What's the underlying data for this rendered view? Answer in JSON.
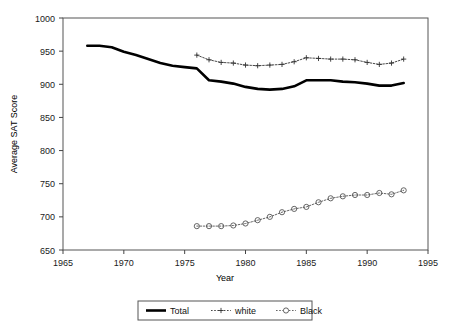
{
  "figure": {
    "title": "",
    "background": "#ffffff",
    "frame_color": "#555555"
  },
  "axes": {
    "y_axis_label": "Average SAT Score",
    "x_axis_label": "Year",
    "y_ticks": [
      650,
      700,
      750,
      800,
      850,
      900,
      950,
      1000
    ],
    "x_ticks": [
      1965,
      1970,
      1975,
      1980,
      1985,
      1990,
      1995
    ],
    "xlim": [
      1965,
      1995
    ],
    "ylim": [
      650,
      1000
    ],
    "grid": false
  },
  "legend": {
    "position": "bottom-center",
    "entries": [
      {
        "label": "Total",
        "marker": "none",
        "style": "thick-solid",
        "color": "#000000"
      },
      {
        "label": "white",
        "marker": "plus",
        "style": "dotted",
        "color": "#333333"
      },
      {
        "label": "Black",
        "marker": "circle",
        "style": "dotted",
        "color": "#555555"
      }
    ]
  },
  "chart_data": {
    "type": "line",
    "title": "",
    "xlabel": "Year",
    "ylabel": "Average SAT Score",
    "xlim": [
      1965,
      1995
    ],
    "ylim": [
      650,
      1000
    ],
    "xticks": [
      1965,
      1970,
      1975,
      1980,
      1985,
      1990,
      1995
    ],
    "yticks": [
      650,
      700,
      750,
      800,
      850,
      900,
      950,
      1000
    ],
    "grid": false,
    "legend_position": "bottom-center",
    "series": [
      {
        "name": "Total",
        "marker": "none",
        "linestyle": "thick-solid",
        "color": "#000000",
        "x": [
          1967,
          1968,
          1969,
          1970,
          1971,
          1972,
          1973,
          1974,
          1975,
          1976,
          1977,
          1978,
          1979,
          1980,
          1981,
          1982,
          1983,
          1984,
          1985,
          1986,
          1987,
          1988,
          1989,
          1990,
          1991,
          1992,
          1993
        ],
        "values": [
          958,
          958,
          956,
          949,
          944,
          938,
          932,
          928,
          926,
          924,
          906,
          904,
          901,
          896,
          893,
          892,
          893,
          897,
          906,
          906,
          906,
          904,
          903,
          901,
          898,
          898,
          902
        ]
      },
      {
        "name": "white",
        "marker": "plus",
        "linestyle": "dotted",
        "color": "#333333",
        "x": [
          1976,
          1977,
          1978,
          1979,
          1980,
          1981,
          1982,
          1983,
          1984,
          1985,
          1986,
          1987,
          1988,
          1989,
          1990,
          1991,
          1992,
          1993
        ],
        "values": [
          944,
          937,
          933,
          932,
          929,
          928,
          929,
          930,
          934,
          940,
          939,
          938,
          938,
          937,
          933,
          930,
          932,
          938
        ]
      },
      {
        "name": "Black",
        "marker": "circle",
        "linestyle": "dotted",
        "color": "#555555",
        "x": [
          1976,
          1977,
          1978,
          1979,
          1980,
          1981,
          1982,
          1983,
          1984,
          1985,
          1986,
          1987,
          1988,
          1989,
          1990,
          1991,
          1992,
          1993
        ],
        "values": [
          686,
          686,
          686,
          687,
          690,
          695,
          700,
          707,
          712,
          715,
          722,
          728,
          731,
          733,
          733,
          736,
          734,
          740
        ]
      }
    ]
  }
}
